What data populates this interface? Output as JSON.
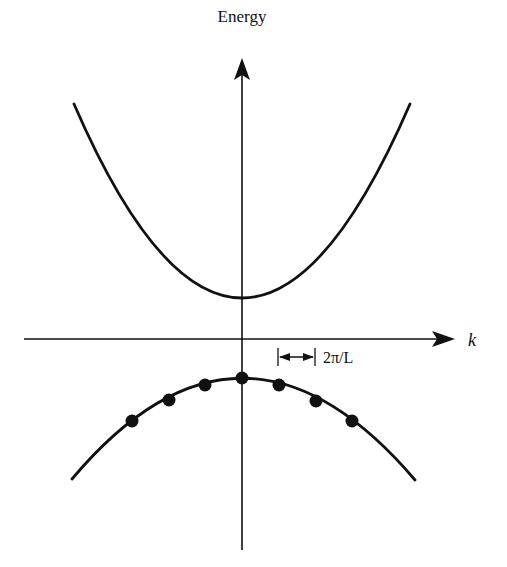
{
  "diagram": {
    "type": "band_structure",
    "y_axis": {
      "label": "Energy"
    },
    "x_axis": {
      "label": "k"
    },
    "spacing_marker": {
      "label": "2π/L"
    },
    "upper_band": {
      "shape": "parabola-up",
      "vertex": [
        242,
        298
      ],
      "left_end": [
        74,
        104
      ],
      "right_end": [
        410,
        104
      ]
    },
    "lower_band": {
      "shape": "parabola-down",
      "vertex": [
        242,
        378
      ],
      "left_end": [
        72,
        479
      ],
      "right_end": [
        415,
        480
      ]
    },
    "states": [
      {
        "x": 132,
        "y": 421
      },
      {
        "x": 169,
        "y": 400
      },
      {
        "x": 205,
        "y": 385
      },
      {
        "x": 242,
        "y": 378
      },
      {
        "x": 279,
        "y": 385
      },
      {
        "x": 316,
        "y": 401
      },
      {
        "x": 352,
        "y": 421
      }
    ],
    "colors": {
      "ink": "#111111",
      "background": "#ffffff"
    }
  }
}
